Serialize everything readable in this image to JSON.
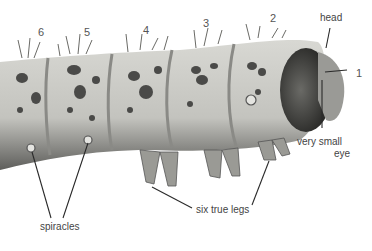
{
  "figure": {
    "segment_numbers": [
      "6",
      "5",
      "4",
      "3",
      "2",
      "1"
    ],
    "labels": {
      "head": "head",
      "eye_line1": "very small",
      "eye_line2": "eye",
      "legs": "six true legs",
      "spiracles": "spiracles"
    },
    "colors": {
      "background": "#ffffff",
      "body": "#c9c9c4",
      "body_shadow": "#7a7a76",
      "spots": "#4a4a48",
      "head": "#3a3a38",
      "label_text": "#444444",
      "leader_lines": "#2a2a2a"
    }
  }
}
